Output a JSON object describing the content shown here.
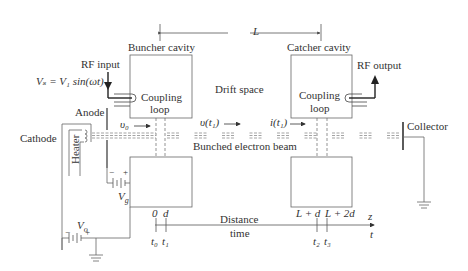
{
  "diagram": {
    "type": "two-cavity klystron schematic",
    "drift_length_label": "L",
    "buncher": {
      "label": "Buncher cavity",
      "coupling_label_1": "Coupling",
      "coupling_label_2": "loop"
    },
    "catcher": {
      "label": "Catcher cavity",
      "coupling_label_1": "Coupling",
      "coupling_label_2": "loop"
    },
    "rf_input": {
      "label": "RF input",
      "equation": "Vₛ = V₁ sin(ωt)"
    },
    "rf_output": {
      "label": "RF output"
    },
    "drift_space": "Drift space",
    "anode": "Anode",
    "cathode": "Cathode",
    "heater": "Heater",
    "collector": "Collector",
    "beam_label": "Bunched electron beam",
    "velocity_v0": "υ₀",
    "velocity_vt1": "υ(t₁)",
    "current_it1": "i(t₁)",
    "grid_voltage": "V",
    "grid_voltage_sub": "g",
    "beam_voltage": "V",
    "beam_voltage_sub": "o",
    "minus": "−",
    "plus": "+",
    "axis": {
      "distance_label": "Distance",
      "time_label": "time",
      "z": "z",
      "t": "t",
      "pos_0": "0",
      "pos_d": "d",
      "pos_Ld": "L + d",
      "pos_L2d": "L + 2d",
      "t0": "t₀",
      "t1": "t₁",
      "t2": "t₂",
      "t3": "t₃"
    },
    "colors": {
      "line": "#555555",
      "text": "#333333",
      "beam": "#888888",
      "background": "#ffffff"
    }
  }
}
